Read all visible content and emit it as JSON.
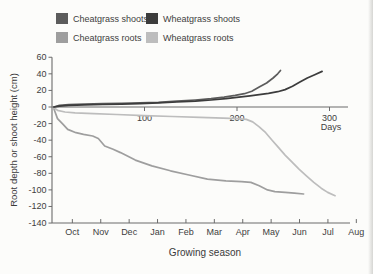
{
  "figure": {
    "background": "#fcfcfa",
    "axis_color": "#6b6b6b",
    "text_color": "#3e3e3e"
  },
  "chart_data": {
    "type": "line",
    "title": "",
    "xlabel": "Growing season",
    "x2label": "Days",
    "ylabel": "Root depth or shoot height (cm)",
    "ylim": [
      -140,
      60
    ],
    "xlim_days": [
      0,
      320
    ],
    "grid": "off",
    "legend_position": "top",
    "y_ticks": [
      60,
      40,
      20,
      0,
      -20,
      -40,
      -60,
      -80,
      -100,
      -120,
      -140
    ],
    "day_ticks": [
      100,
      200,
      300
    ],
    "month_labels": [
      "Oct",
      "Nov",
      "Dec",
      "Jan",
      "Feb",
      "Mar",
      "Apr",
      "May",
      "Jun",
      "Jul",
      "Aug"
    ],
    "month_days": [
      22,
      52.7,
      83.4,
      114.1,
      144.8,
      175.5,
      206.2,
      236.9,
      267.6,
      298.3,
      329
    ],
    "legend_order": [
      0,
      1,
      2,
      3
    ],
    "draw_order": [
      2,
      3,
      0,
      1
    ],
    "series": [
      {
        "name": "Cheatgrass shoots",
        "color": "#5c5c5c",
        "units": "cm vs day",
        "points": [
          [
            2,
            0
          ],
          [
            8,
            2
          ],
          [
            18,
            3
          ],
          [
            35,
            3.5
          ],
          [
            55,
            4
          ],
          [
            75,
            4.5
          ],
          [
            95,
            5
          ],
          [
            115,
            5.5
          ],
          [
            135,
            7
          ],
          [
            155,
            8.5
          ],
          [
            172,
            10
          ],
          [
            186,
            12
          ],
          [
            198,
            14
          ],
          [
            208,
            16
          ],
          [
            216,
            19
          ],
          [
            224,
            24
          ],
          [
            232,
            29
          ],
          [
            239,
            35
          ],
          [
            244,
            40
          ],
          [
            247,
            44
          ]
        ]
      },
      {
        "name": "Wheatgrass shoots",
        "color": "#3c3c3c",
        "units": "cm vs day",
        "points": [
          [
            2,
            0
          ],
          [
            8,
            1
          ],
          [
            18,
            2
          ],
          [
            35,
            2.5
          ],
          [
            55,
            3
          ],
          [
            75,
            3.5
          ],
          [
            95,
            4
          ],
          [
            115,
            5
          ],
          [
            135,
            6
          ],
          [
            155,
            7
          ],
          [
            172,
            8.5
          ],
          [
            188,
            10
          ],
          [
            202,
            12
          ],
          [
            214,
            13.5
          ],
          [
            224,
            15
          ],
          [
            234,
            16.5
          ],
          [
            244,
            18.5
          ],
          [
            252,
            21
          ],
          [
            260,
            25
          ],
          [
            268,
            30
          ],
          [
            276,
            35
          ],
          [
            284,
            39
          ],
          [
            292,
            43
          ]
        ]
      },
      {
        "name": "Cheatgrass roots",
        "color": "#9e9e9e",
        "units": "cm vs day",
        "points": [
          [
            2,
            -2
          ],
          [
            6,
            -14
          ],
          [
            12,
            -21
          ],
          [
            17,
            -27
          ],
          [
            26,
            -31
          ],
          [
            34,
            -33
          ],
          [
            44,
            -35
          ],
          [
            50,
            -38
          ],
          [
            57,
            -47
          ],
          [
            66,
            -51
          ],
          [
            74,
            -55
          ],
          [
            90,
            -64
          ],
          [
            108,
            -71
          ],
          [
            128,
            -77
          ],
          [
            148,
            -82
          ],
          [
            168,
            -87
          ],
          [
            188,
            -89
          ],
          [
            205,
            -90
          ],
          [
            215,
            -91
          ],
          [
            224,
            -95
          ],
          [
            233,
            -100
          ],
          [
            241,
            -102
          ],
          [
            252,
            -103
          ],
          [
            262,
            -104
          ],
          [
            272,
            -105
          ]
        ]
      },
      {
        "name": "Wheatgrass roots",
        "color": "#bdbdbd",
        "units": "cm vs day",
        "points": [
          [
            2,
            -1
          ],
          [
            6,
            -4
          ],
          [
            14,
            -6
          ],
          [
            25,
            -7
          ],
          [
            45,
            -8
          ],
          [
            70,
            -9
          ],
          [
            100,
            -10.5
          ],
          [
            130,
            -11.5
          ],
          [
            160,
            -12.5
          ],
          [
            185,
            -13.5
          ],
          [
            200,
            -14
          ],
          [
            210,
            -15
          ],
          [
            217,
            -18
          ],
          [
            224,
            -24
          ],
          [
            231,
            -31
          ],
          [
            238,
            -40
          ],
          [
            245,
            -49
          ],
          [
            252,
            -58
          ],
          [
            259,
            -66
          ],
          [
            267,
            -75
          ],
          [
            275,
            -83
          ],
          [
            283,
            -91
          ],
          [
            291,
            -98
          ],
          [
            298,
            -103
          ],
          [
            306,
            -107
          ]
        ]
      }
    ]
  }
}
